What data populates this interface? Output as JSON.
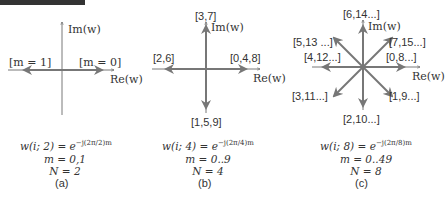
{
  "panels": [
    {
      "id": "a",
      "caption": "(a)",
      "axis_im": "Im(w)",
      "axis_re": "Re(w)",
      "labels": {
        "right": "[m = 0]",
        "left": "[m = 1]"
      },
      "formula": {
        "lhs": "w(i; 2) = e",
        "exponent": "−j(2π/2)m",
        "m_range": "m = 0,1",
        "N": "N = 2"
      }
    },
    {
      "id": "b",
      "caption": "(b)",
      "axis_im": "Im(w)",
      "axis_re": "Re(w)",
      "labels": {
        "up": "[3,7]",
        "left": "[2,6]",
        "right": "[0,4,8]",
        "down": "[1,5,9]"
      },
      "formula": {
        "lhs": "w(i; 4) = e",
        "exponent": "−j(2π/4)m",
        "m_range": "m = 0..9",
        "N": "N = 4"
      }
    },
    {
      "id": "c",
      "caption": "(c)",
      "axis_im": "Im(w)",
      "axis_re": "Re(w)",
      "labels": {
        "up": "[6,14...]",
        "upleft": "[5,13 ...]",
        "upright": "[7,15...]",
        "left": "[4,12...]",
        "right": "[0,8...]",
        "downleft": "[3,11...]",
        "downright": "[1,9...]",
        "down": "[2,10...]"
      },
      "formula": {
        "lhs": "w(i; 8) = e",
        "exponent": "−j(2π/8)m",
        "m_range": "m = 0..49",
        "N": "N = 8"
      }
    }
  ],
  "colors": {
    "axis": "#555555",
    "arrow": "#777777",
    "text": "#333333"
  }
}
